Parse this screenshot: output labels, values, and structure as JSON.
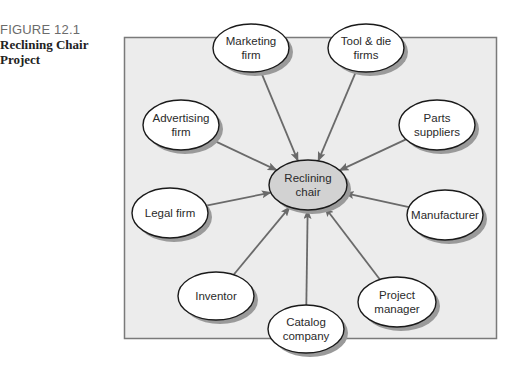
{
  "figure": {
    "number": "FIGURE 12.1",
    "title_line1": "Reclining Chair",
    "title_line2": "Project"
  },
  "colors": {
    "panel_fill": "#ececec",
    "panel_border": "#7a7a7a",
    "node_fill": "#ffffff",
    "center_fill": "#d2d2d2",
    "node_stroke": "#1a1a1a",
    "shadow": "#9a9a9a",
    "arrow": "#6a6a6a"
  },
  "center": {
    "id": "reclining-chair",
    "lines": [
      "Reclining",
      "chair"
    ],
    "cx": 308,
    "cy": 185,
    "rx": 39,
    "ry": 25
  },
  "nodes": [
    {
      "id": "marketing-firm",
      "lines": [
        "Marketing",
        "firm"
      ],
      "cx": 251,
      "cy": 48,
      "rx": 38,
      "ry": 24
    },
    {
      "id": "tool-die-firms",
      "lines": [
        "Tool & die",
        "firms"
      ],
      "cx": 366,
      "cy": 48,
      "rx": 38,
      "ry": 24
    },
    {
      "id": "parts-suppliers",
      "lines": [
        "Parts",
        "suppliers"
      ],
      "cx": 437,
      "cy": 125,
      "rx": 38,
      "ry": 25
    },
    {
      "id": "advertising-firm",
      "lines": [
        "Advertising",
        "firm"
      ],
      "cx": 181,
      "cy": 125,
      "rx": 38,
      "ry": 25
    },
    {
      "id": "legal-firm",
      "lines": [
        "Legal firm"
      ],
      "cx": 170,
      "cy": 213,
      "rx": 38,
      "ry": 25
    },
    {
      "id": "manufacturer",
      "lines": [
        "Manufacturer"
      ],
      "cx": 445,
      "cy": 215,
      "rx": 38,
      "ry": 25
    },
    {
      "id": "inventor",
      "lines": [
        "Inventor"
      ],
      "cx": 216,
      "cy": 296,
      "rx": 38,
      "ry": 24
    },
    {
      "id": "catalog-company",
      "lines": [
        "Catalog",
        "company"
      ],
      "cx": 306,
      "cy": 329,
      "rx": 38,
      "ry": 24
    },
    {
      "id": "project-manager",
      "lines": [
        "Project",
        "manager"
      ],
      "cx": 397,
      "cy": 302,
      "rx": 39,
      "ry": 25
    }
  ],
  "edges_direction": "all nodes point to center (Reclining chair)"
}
